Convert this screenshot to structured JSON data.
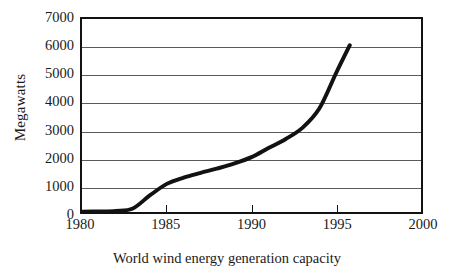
{
  "chart_data": {
    "type": "line",
    "title": "",
    "caption": "World wind energy generation capacity",
    "xlabel": "",
    "ylabel": "Megawatts",
    "xlim": [
      1980,
      2000
    ],
    "ylim": [
      0,
      7000
    ],
    "grid": true,
    "legend": null,
    "x_ticks": [
      1980,
      1985,
      1990,
      1995,
      2000
    ],
    "x_tick_labels": [
      "1980",
      "1985",
      "1990",
      "1995",
      "2000"
    ],
    "y_ticks": [
      0,
      1000,
      2000,
      3000,
      4000,
      5000,
      6000,
      7000
    ],
    "y_tick_labels": [
      "0",
      "1000",
      "2000",
      "3000",
      "4000",
      "5000",
      "6000",
      "7000"
    ],
    "series": [
      {
        "name": "World wind energy generation capacity",
        "color": "#121212",
        "line_width": 4,
        "x": [
          1980,
          1981,
          1982,
          1983,
          1984,
          1985,
          1986,
          1987,
          1988,
          1989,
          1990,
          1991,
          1992,
          1993,
          1994,
          1995,
          1995.8
        ],
        "values": [
          10,
          20,
          40,
          130,
          600,
          1020,
          1250,
          1420,
          1580,
          1760,
          1990,
          2320,
          2640,
          3050,
          3750,
          5050,
          6050
        ]
      }
    ]
  },
  "axes": {
    "y_title": "Megawatts",
    "y_tick_labels": [
      "7000",
      "6000",
      "5000",
      "4000",
      "3000",
      "2000",
      "1000",
      "0"
    ],
    "x_tick_labels": [
      "1980",
      "1985",
      "1990",
      "1995",
      "2000"
    ]
  },
  "caption": {
    "text": "World wind energy generation capacity"
  },
  "colors": {
    "line": "#121212",
    "frame": "#121212",
    "gridline": "#5a5a5a",
    "background": "#ffffff"
  }
}
